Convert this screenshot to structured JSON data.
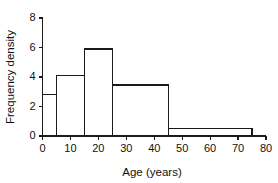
{
  "chart_data": {
    "type": "bar",
    "title": "",
    "xlabel": "Age (years)",
    "ylabel": "Frequency density",
    "xlim": [
      0,
      80
    ],
    "ylim": [
      0,
      8
    ],
    "grid": false,
    "legend": "none",
    "xticks": [
      0,
      10,
      20,
      30,
      40,
      50,
      60,
      70,
      80
    ],
    "xtick_labels": [
      "0",
      "10",
      "20",
      "30",
      "40",
      "50",
      "60",
      "70",
      "80"
    ],
    "yticks": [
      0,
      2,
      4,
      6,
      8
    ],
    "ytick_labels": [
      "0",
      "2",
      "4",
      "6",
      "8"
    ],
    "bin_edges": [
      0,
      5,
      15,
      25,
      45,
      75
    ],
    "categories": [
      "0-5",
      "5-15",
      "15-25",
      "25-45",
      "45-75"
    ],
    "values": [
      2.8,
      4.1,
      5.9,
      3.45,
      0.5
    ],
    "bars": [
      {
        "label": "0-5",
        "x0": 0,
        "x1": 5,
        "density": 2.8
      },
      {
        "label": "5-15",
        "x0": 5,
        "x1": 15,
        "density": 4.1
      },
      {
        "label": "15-25",
        "x0": 15,
        "x1": 25,
        "density": 5.9
      },
      {
        "label": "25-45",
        "x0": 25,
        "x1": 45,
        "density": 3.45
      },
      {
        "label": "45-75",
        "x0": 45,
        "x1": 75,
        "density": 0.5
      }
    ],
    "colors": {
      "bar_fill": "none",
      "bar_stroke": "#1a1a1a",
      "axis": "#1a1a1a",
      "text": "#111111",
      "background": "#ffffff"
    }
  }
}
